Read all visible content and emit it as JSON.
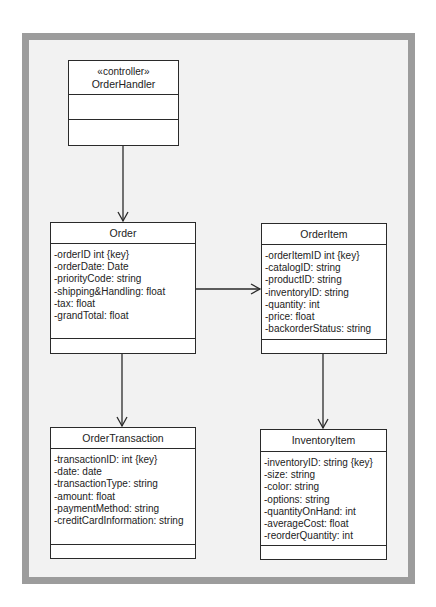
{
  "diagram": {
    "type": "UML class diagram",
    "classes": {
      "order_handler": {
        "stereotype": "«controller»",
        "name": "OrderHandler",
        "attributes": [],
        "operations": []
      },
      "order": {
        "name": "Order",
        "attributes": [
          "-orderID int {key}",
          "-orderDate: Date",
          "-priorityCode: string",
          "-shipping&Handling: float",
          "-tax: float",
          "-grandTotal: float"
        ],
        "operations": []
      },
      "order_item": {
        "name": "OrderItem",
        "attributes": [
          "-orderItemID int {key}",
          "-catalogID: string",
          "-productID: string",
          "-inventoryID: string",
          "-quantity: int",
          "-price: float",
          "-backorderStatus: string"
        ],
        "operations": []
      },
      "order_transaction": {
        "name": "OrderTransaction",
        "attributes": [
          "-transactionID: int {key}",
          "-date: date",
          "-transactionType: string",
          "-amount: float",
          "-paymentMethod: string",
          "-creditCardInformation: string"
        ],
        "operations": []
      },
      "inventory_item": {
        "name": "InventoryItem",
        "attributes": [
          "-inventoryID: string {key}",
          "-size: string",
          "-color: string",
          "-options: string",
          "-quantityOnHand: int",
          "-averageCost: float",
          "-reorderQuantity: int"
        ],
        "operations": []
      }
    },
    "associations": [
      {
        "from": "OrderHandler",
        "to": "Order",
        "navigable": true
      },
      {
        "from": "Order",
        "to": "OrderItem",
        "navigable": true
      },
      {
        "from": "Order",
        "to": "OrderTransaction",
        "navigable": true
      },
      {
        "from": "OrderItem",
        "to": "InventoryItem",
        "navigable": true
      }
    ],
    "colors": {
      "frame_border": "#9c9c9c",
      "frame_fill": "#f2f2f2",
      "box_fill": "#ffffff",
      "line": "#2a2a2a"
    }
  }
}
